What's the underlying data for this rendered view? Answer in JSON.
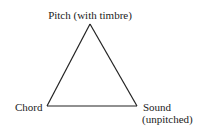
{
  "diagram": {
    "type": "triangle",
    "vertices": {
      "top": {
        "label": "Pitch (with timbre)"
      },
      "bottom_left": {
        "label": "Chord"
      },
      "bottom_right": {
        "label": "Sound",
        "sublabel": "(unpitched)"
      }
    },
    "colors": {
      "stroke": "#222222",
      "text": "#222222",
      "background": "#ffffff"
    }
  }
}
